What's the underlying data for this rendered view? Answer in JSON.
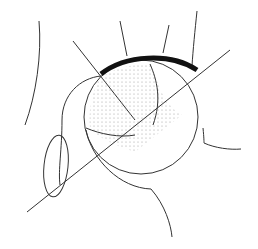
{
  "diagram": {
    "colors": {
      "background": "#ffffff",
      "stroke": "#333333",
      "roof": "#111111",
      "stipple": "#9a9a9a"
    },
    "elements": [
      {
        "name": "acetabular-roof",
        "desc": "thick black arc over femoral head"
      },
      {
        "name": "femoral-head",
        "desc": "circle with stippled region"
      },
      {
        "name": "reference-line",
        "desc": "long oblique line from lower-left to upper-right"
      },
      {
        "name": "obturator-foramen",
        "desc": "small ellipse at lower left"
      },
      {
        "name": "ilium-outline",
        "desc": "curved outline on far left"
      }
    ]
  }
}
